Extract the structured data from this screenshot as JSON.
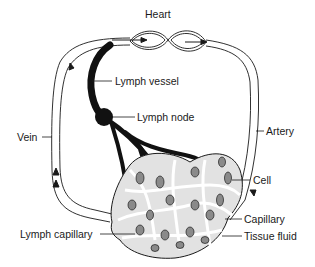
{
  "diagram": {
    "type": "circulatory-lymphatic-system",
    "labels": {
      "heart": "Heart",
      "lymph_vessel": "Lymph vessel",
      "lymph_node": "Lymph node",
      "vein": "Vein",
      "artery": "Artery",
      "cell": "Cell",
      "capillary": "Capillary",
      "lymph_capillary": "Lymph capillary",
      "tissue_fluid": "Tissue fluid"
    },
    "colors": {
      "line": "#1a1a1a",
      "lymph": "#111111",
      "tissue_fill": "#d9d9d9",
      "cell_fill": "#8a8a8a",
      "background": "#ffffff"
    }
  }
}
